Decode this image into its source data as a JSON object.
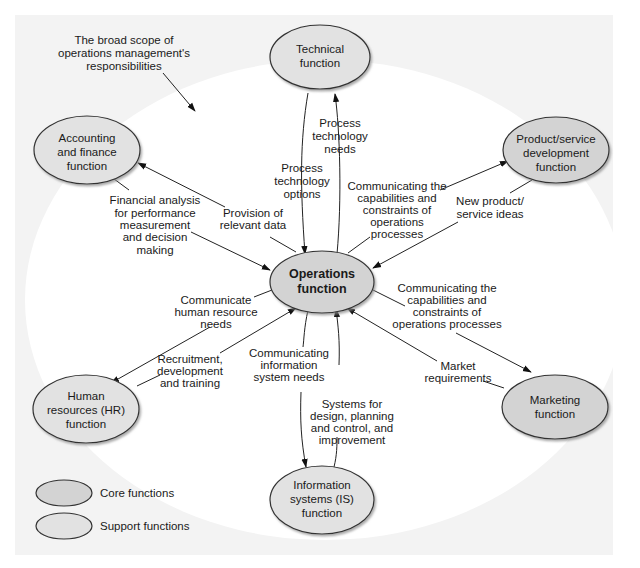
{
  "caption": [
    "The broad scope of",
    "operations management's",
    "responsibilities"
  ],
  "colors": {
    "background_panel": "#f3f3f3",
    "inner_area": "#ffffff",
    "core_fill": "#d3d3d3",
    "support_fill": "#e2e2e2",
    "stroke": "#333333"
  },
  "nodes": {
    "operations": {
      "lines": [
        "Operations",
        "function"
      ],
      "type": "core"
    },
    "technical": {
      "lines": [
        "Technical",
        "function"
      ],
      "type": "support"
    },
    "accounting": {
      "lines": [
        "Accounting",
        "and finance",
        "function"
      ],
      "type": "support"
    },
    "product": {
      "lines": [
        "Product/service",
        "development",
        "function"
      ],
      "type": "core"
    },
    "hr": {
      "lines": [
        "Human",
        "resources (HR)",
        "function"
      ],
      "type": "support"
    },
    "marketing": {
      "lines": [
        "Marketing",
        "function"
      ],
      "type": "core"
    },
    "is": {
      "lines": [
        "Information",
        "systems (IS)",
        "function"
      ],
      "type": "support"
    }
  },
  "edges": {
    "tech_needs": [
      "Process",
      "technology",
      "needs"
    ],
    "tech_options": [
      "Process",
      "technology",
      "options"
    ],
    "acct_analysis": [
      "Financial analysis",
      "for performance",
      "measurement",
      "and decision",
      "making"
    ],
    "acct_data": [
      "Provision of",
      "relevant data"
    ],
    "prod_comm": [
      "Communicating the",
      "capabilities and",
      "constraints of",
      "operations",
      "processes"
    ],
    "prod_ideas": [
      "New product/",
      "service ideas"
    ],
    "hr_needs": [
      "Communicate",
      "human resource",
      "needs"
    ],
    "hr_recruit": [
      "Recruitment,",
      "development",
      "and training"
    ],
    "mkt_comm": [
      "Communicating the",
      "capabilities and",
      "constraints of",
      "operations processes"
    ],
    "mkt_req": [
      "Market",
      "requirements"
    ],
    "is_needs": [
      "Communicating",
      "information",
      "system needs"
    ],
    "is_systems": [
      "Systems for",
      "design, planning",
      "and control, and",
      "improvement"
    ]
  },
  "legend": {
    "core": "Core functions",
    "support": "Support functions"
  }
}
